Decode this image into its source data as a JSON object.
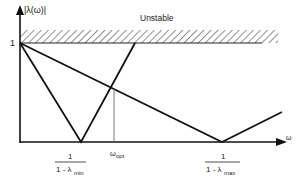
{
  "diagram": {
    "y_axis_label": "|λ(ω)|",
    "x_axis_label": "ω",
    "unstable_label": "Unstable",
    "y_tick_label": "1",
    "x_labels": {
      "min": {
        "numerator": "1",
        "denominator_prefix": "1 - λ",
        "subscript": "min"
      },
      "opt": {
        "main": "ω",
        "subscript": "opt"
      },
      "max": {
        "numerator": "1",
        "denominator_prefix": "1 - λ",
        "subscript": "max"
      }
    },
    "colors": {
      "line": "#111111",
      "hatch": "#333333",
      "guide": "#777777"
    }
  }
}
